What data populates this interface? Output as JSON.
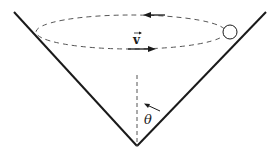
{
  "diagram": {
    "labels": {
      "velocity": "v",
      "angle": "θ"
    },
    "colors": {
      "line": "#1a1a1a",
      "dashed": "#555555",
      "background": "#ffffff"
    },
    "elements": {
      "cone": {
        "apex": [
          137,
          146
        ],
        "left_top": [
          14,
          12
        ],
        "right_top": [
          266,
          12
        ]
      },
      "orbit": {
        "cx": 133,
        "cy": 32,
        "rx": 98,
        "ry": 17
      },
      "ball": {
        "cx": 230,
        "cy": 32,
        "r": 7
      },
      "axis": {
        "x": 137,
        "y1": 75,
        "y2": 146
      }
    }
  }
}
